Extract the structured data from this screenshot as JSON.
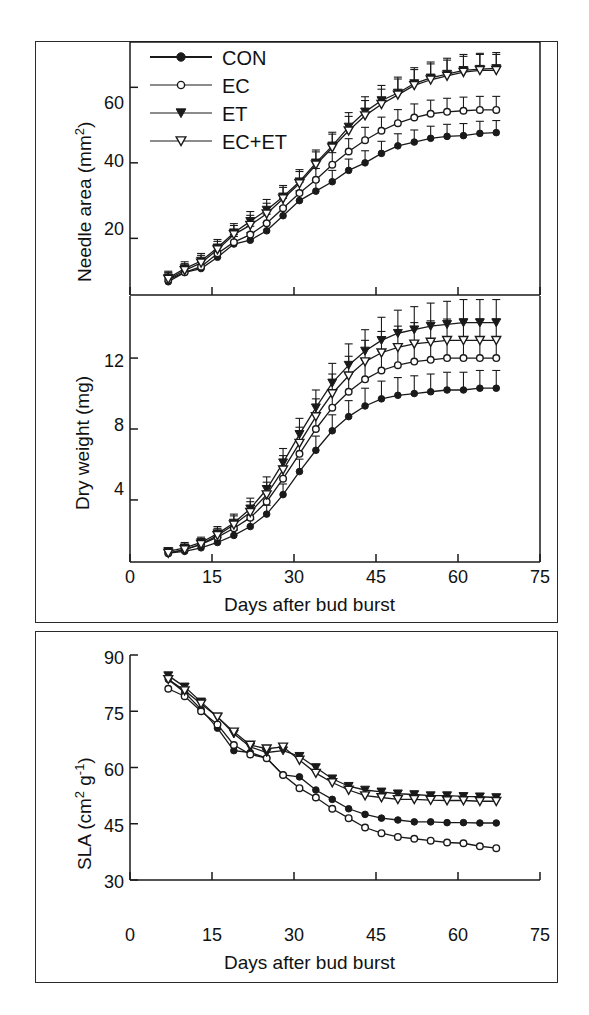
{
  "figure": {
    "background": "#ffffff",
    "ink_color": "#1a1a1a"
  },
  "legend": {
    "position": "top-left of panel A",
    "entries": [
      {
        "label": "CON",
        "marker": "filled-circle",
        "name": "legend-item-con"
      },
      {
        "label": "EC",
        "marker": "open-circle",
        "name": "legend-item-ec"
      },
      {
        "label": "ET",
        "marker": "filled-triangle-down",
        "name": "legend-item-et"
      },
      {
        "label": "EC+ET",
        "marker": "open-triangle-down",
        "name": "legend-item-ecet"
      }
    ]
  },
  "axes": {
    "x_label": "Days after bud burst",
    "x_ticks": [
      "0",
      "15",
      "30",
      "45",
      "60",
      "75"
    ],
    "panel_a_y_ticks": [
      "20",
      "40",
      "60"
    ],
    "panel_b_y_ticks": [
      "4",
      "8",
      "12"
    ],
    "panel_c_y_ticks": [
      "30",
      "45",
      "60",
      "75",
      "90"
    ],
    "panel_a_y_label_main": "Needle area (mm",
    "panel_a_y_label_sup": "2",
    "panel_a_y_label_tail": ")",
    "panel_b_y_label": "Dry weight (mg)",
    "panel_c_y_label_main": "SLA (cm",
    "panel_c_y_label_sup": "2",
    "panel_c_y_label_mid": " g",
    "panel_c_y_label_sup2": "-1",
    "panel_c_y_label_tail": ")"
  },
  "chart_data": [
    {
      "id": "panel-a-needle-area",
      "type": "line",
      "title": "",
      "xlabel": "",
      "ylabel": "Needle area (mm2)",
      "xlim": [
        0,
        75
      ],
      "ylim": [
        5,
        72
      ],
      "xticks": [
        0,
        15,
        30,
        45,
        60,
        75
      ],
      "yticks": [
        20,
        40,
        60
      ],
      "grid": false,
      "legend_position": "upper-left",
      "errorbars": "SE, symmetric, vertical",
      "x": [
        7,
        10,
        13,
        16,
        19,
        22,
        25,
        28,
        31,
        34,
        37,
        40,
        43,
        46,
        49,
        52,
        55,
        58,
        61,
        64,
        67
      ],
      "series": [
        {
          "name": "CON",
          "marker": "filled-circle",
          "values": [
            8.5,
            11.0,
            12.0,
            15.0,
            18.5,
            19.5,
            22.0,
            26.0,
            30.0,
            32.5,
            35.0,
            38.0,
            40.0,
            42.5,
            44.5,
            45.5,
            46.5,
            47.0,
            47.2,
            47.8,
            48.0
          ],
          "errors": [
            1.8,
            1.8,
            1.8,
            1.8,
            2.0,
            2.0,
            2.2,
            2.4,
            2.6,
            2.8,
            3.0,
            3.0,
            3.2,
            3.2,
            3.2,
            3.2,
            3.2,
            3.2,
            3.2,
            3.2,
            3.2
          ]
        },
        {
          "name": "EC",
          "marker": "open-circle",
          "values": [
            9.0,
            11.0,
            12.5,
            16.0,
            19.0,
            21.0,
            24.0,
            28.0,
            32.0,
            35.5,
            39.5,
            43.0,
            46.0,
            48.5,
            50.5,
            52.0,
            53.0,
            53.5,
            53.8,
            54.0,
            54.0
          ],
          "errors": [
            1.8,
            1.8,
            1.8,
            2.0,
            2.0,
            2.2,
            2.4,
            2.6,
            2.8,
            3.0,
            3.2,
            3.4,
            3.4,
            3.6,
            3.6,
            3.6,
            3.6,
            3.6,
            3.6,
            3.6,
            3.6
          ]
        },
        {
          "name": "ET",
          "marker": "filled-triangle-down",
          "values": [
            9.5,
            12.0,
            14.0,
            17.5,
            21.5,
            24.5,
            27.5,
            31.0,
            35.0,
            40.0,
            44.5,
            49.5,
            53.5,
            56.5,
            58.5,
            61.0,
            62.5,
            63.5,
            64.5,
            64.8,
            65.0
          ],
          "errors": [
            1.8,
            1.8,
            2.0,
            2.2,
            2.4,
            2.6,
            2.8,
            3.0,
            3.2,
            3.4,
            3.6,
            3.8,
            4.0,
            4.0,
            4.2,
            4.2,
            4.2,
            4.2,
            4.2,
            4.2,
            4.2
          ]
        },
        {
          "name": "EC+ET",
          "marker": "open-triangle-down",
          "values": [
            9.2,
            11.5,
            13.5,
            17.0,
            21.0,
            23.5,
            26.5,
            30.5,
            34.5,
            39.5,
            44.0,
            48.5,
            52.5,
            55.5,
            58.0,
            60.5,
            62.0,
            63.0,
            64.0,
            64.5,
            64.5
          ],
          "errors": [
            1.8,
            1.8,
            2.0,
            2.2,
            2.4,
            2.6,
            2.8,
            3.0,
            3.2,
            3.4,
            3.6,
            3.8,
            4.0,
            4.0,
            4.2,
            4.2,
            4.2,
            4.2,
            4.2,
            4.2,
            4.2
          ]
        }
      ]
    },
    {
      "id": "panel-b-dry-weight",
      "type": "line",
      "title": "",
      "xlabel": "Days after bud burst",
      "ylabel": "Dry weight (mg)",
      "xlim": [
        0,
        75
      ],
      "ylim": [
        0.5,
        15.5
      ],
      "xticks": [
        0,
        15,
        30,
        45,
        60,
        75
      ],
      "yticks": [
        4,
        8,
        12
      ],
      "grid": false,
      "errorbars": "SE, symmetric, vertical",
      "x": [
        7,
        10,
        13,
        16,
        19,
        22,
        25,
        28,
        31,
        34,
        37,
        40,
        43,
        46,
        49,
        52,
        55,
        58,
        61,
        64,
        67
      ],
      "series": [
        {
          "name": "CON",
          "marker": "filled-circle",
          "values": [
            1.0,
            1.1,
            1.3,
            1.6,
            2.0,
            2.5,
            3.2,
            4.3,
            5.6,
            6.8,
            7.9,
            8.7,
            9.3,
            9.7,
            9.9,
            10.0,
            10.1,
            10.2,
            10.2,
            10.3,
            10.3
          ],
          "errors": [
            0.2,
            0.2,
            0.2,
            0.3,
            0.3,
            0.4,
            0.5,
            0.6,
            0.7,
            0.8,
            0.9,
            0.9,
            1.0,
            1.0,
            1.0,
            1.0,
            1.0,
            1.0,
            1.0,
            1.0,
            1.0
          ]
        },
        {
          "name": "EC",
          "marker": "open-circle",
          "values": [
            1.0,
            1.2,
            1.5,
            1.9,
            2.4,
            3.0,
            3.9,
            5.2,
            6.6,
            8.0,
            9.2,
            10.1,
            10.8,
            11.3,
            11.6,
            11.8,
            11.9,
            12.0,
            12.0,
            12.0,
            12.0
          ],
          "errors": [
            0.2,
            0.2,
            0.3,
            0.3,
            0.4,
            0.5,
            0.6,
            0.7,
            0.8,
            0.9,
            1.0,
            1.0,
            1.1,
            1.1,
            1.1,
            1.1,
            1.1,
            1.1,
            1.1,
            1.1,
            1.1
          ]
        },
        {
          "name": "ET",
          "marker": "filled-triangle-down",
          "values": [
            1.1,
            1.3,
            1.6,
            2.1,
            2.7,
            3.5,
            4.6,
            6.1,
            7.7,
            9.2,
            10.6,
            11.6,
            12.4,
            13.0,
            13.4,
            13.6,
            13.8,
            13.9,
            14.0,
            14.0,
            14.0
          ],
          "errors": [
            0.2,
            0.3,
            0.3,
            0.4,
            0.5,
            0.6,
            0.7,
            0.8,
            0.9,
            1.0,
            1.1,
            1.2,
            1.2,
            1.3,
            1.3,
            1.3,
            1.3,
            1.3,
            1.3,
            1.3,
            1.3
          ]
        },
        {
          "name": "EC+ET",
          "marker": "open-triangle-down",
          "values": [
            1.0,
            1.2,
            1.5,
            2.0,
            2.6,
            3.3,
            4.3,
            5.7,
            7.2,
            8.7,
            10.0,
            11.0,
            11.8,
            12.3,
            12.6,
            12.8,
            12.9,
            13.0,
            13.0,
            13.0,
            13.0
          ],
          "errors": [
            0.2,
            0.3,
            0.3,
            0.4,
            0.5,
            0.6,
            0.7,
            0.8,
            0.9,
            1.0,
            1.1,
            1.1,
            1.2,
            1.2,
            1.2,
            1.2,
            1.2,
            1.2,
            1.2,
            1.2,
            1.2
          ]
        }
      ]
    },
    {
      "id": "panel-c-sla",
      "type": "line",
      "title": "",
      "xlabel": "Days after bud burst",
      "ylabel": "SLA (cm2 g-1)",
      "xlim": [
        0,
        75
      ],
      "ylim": [
        30,
        90
      ],
      "xticks": [
        0,
        15,
        30,
        45,
        60,
        75
      ],
      "yticks": [
        30,
        45,
        60,
        75,
        90
      ],
      "grid": false,
      "errorbars": "none",
      "x": [
        7,
        10,
        13,
        16,
        19,
        22,
        25,
        28,
        31,
        34,
        37,
        40,
        43,
        46,
        49,
        52,
        55,
        58,
        61,
        64,
        67
      ],
      "series": [
        {
          "name": "CON",
          "marker": "filled-circle",
          "values": [
            83.5,
            80.0,
            75.5,
            70.5,
            64.5,
            64.0,
            62.5,
            58.0,
            57.5,
            54.0,
            51.5,
            49.0,
            47.5,
            46.5,
            46.0,
            45.5,
            45.5,
            45.3,
            45.3,
            45.2,
            45.2
          ]
        },
        {
          "name": "EC",
          "marker": "open-circle",
          "values": [
            81.0,
            79.0,
            75.0,
            71.5,
            66.0,
            63.5,
            62.5,
            58.0,
            54.5,
            52.0,
            49.0,
            46.5,
            44.0,
            42.5,
            41.5,
            41.0,
            40.5,
            40.0,
            39.8,
            39.0,
            38.5
          ]
        },
        {
          "name": "ET",
          "marker": "filled-triangle-down",
          "values": [
            84.5,
            81.5,
            77.5,
            73.5,
            69.0,
            65.5,
            64.0,
            64.5,
            63.0,
            60.0,
            57.0,
            55.0,
            54.0,
            53.5,
            53.0,
            52.8,
            52.5,
            52.5,
            52.3,
            52.2,
            52.0
          ]
        },
        {
          "name": "EC+ET",
          "marker": "open-triangle-down",
          "values": [
            83.5,
            80.5,
            77.0,
            73.5,
            69.5,
            66.0,
            65.0,
            65.5,
            62.0,
            58.5,
            56.0,
            54.0,
            52.5,
            52.0,
            51.5,
            51.5,
            51.3,
            51.2,
            51.2,
            51.0,
            51.0
          ]
        }
      ]
    }
  ]
}
